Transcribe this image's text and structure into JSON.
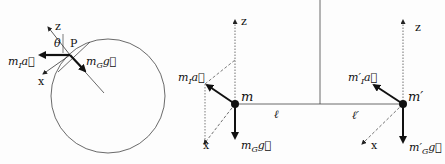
{
  "figure": {
    "left_panel": {
      "axis_z": "z",
      "axis_x": "x",
      "angle": "θ",
      "point": "P",
      "inertial_force": {
        "m": "m",
        "sub": "I",
        "vec": "a⃗"
      },
      "gravity_force": {
        "m": "m",
        "sub": "G",
        "vec": "g⃗"
      }
    },
    "right_panel": {
      "left_mass": {
        "label": "m",
        "axis_z": "z",
        "axis_x": "x",
        "inertial_force": {
          "m": "m",
          "sub": "I",
          "vec": "a⃗"
        },
        "gravity_force": {
          "m": "m",
          "sub": "G",
          "vec": "g⃗"
        },
        "arm": "ℓ"
      },
      "right_mass": {
        "label": "m′",
        "axis_z": "z",
        "axis_x": "x",
        "inertial_force": {
          "m": "m′",
          "sub": "I",
          "vec": "a⃗"
        },
        "gravity_force": {
          "m": "m′",
          "sub": "G",
          "vec": "g⃗"
        },
        "arm": "ℓ′"
      }
    }
  }
}
